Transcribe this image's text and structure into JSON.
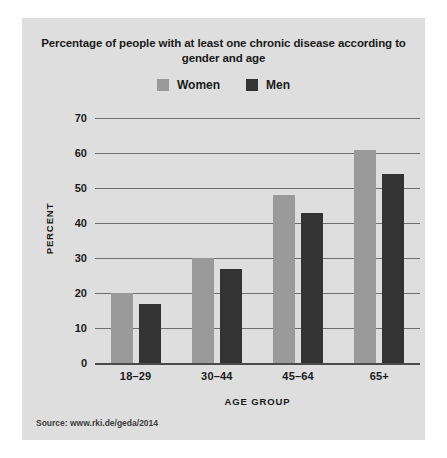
{
  "card": {
    "background_color": "#dedede"
  },
  "title": "Percentage of people with at least one chronic disease according to gender and age",
  "legend": {
    "items": [
      {
        "label": "Women",
        "color": "#9a9a9a"
      },
      {
        "label": "Men",
        "color": "#333333"
      }
    ]
  },
  "axes": {
    "y_title": "PERCENT",
    "x_title": "AGE GROUP",
    "y_ticks": [
      "70",
      "60",
      "50",
      "40",
      "30",
      "20",
      "10",
      "0"
    ]
  },
  "source": "Source: www.rki.de/geda/2014",
  "chart_data": {
    "type": "bar",
    "title": "Percentage of people with at least one chronic disease according to gender and age",
    "categories": [
      "18–29",
      "30–44",
      "45–64",
      "65+"
    ],
    "series": [
      {
        "name": "Women",
        "color": "#9a9a9a",
        "values": [
          20,
          30,
          48,
          61
        ]
      },
      {
        "name": "Men",
        "color": "#333333",
        "values": [
          17,
          27,
          43,
          54
        ]
      }
    ],
    "xlabel": "AGE GROUP",
    "ylabel": "PERCENT",
    "ylim": [
      0,
      70
    ],
    "ytick_step": 10,
    "grid": true,
    "legend_position": "top-center",
    "source": "Source: www.rki.de/geda/2014"
  }
}
